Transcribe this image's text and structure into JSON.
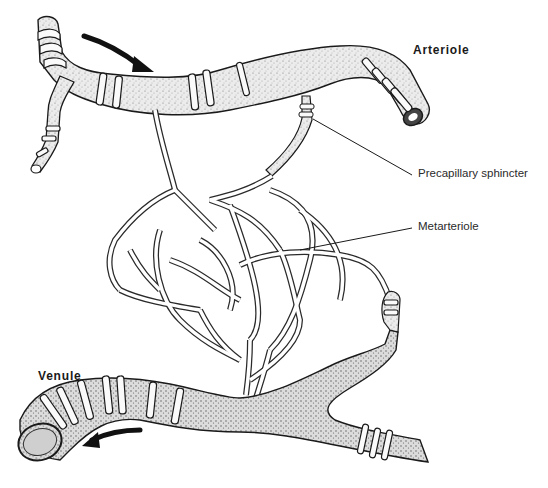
{
  "figure": {
    "type": "anatomical illustration",
    "labels": {
      "arteriole": "Arteriole",
      "precapillary_sphincter": "Precapillary sphincter",
      "metarteriole": "Metarteriole",
      "venule": "Venule"
    },
    "flow_arrows": [
      {
        "name": "arteriole-inflow-arrow",
        "direction": "right/down"
      },
      {
        "name": "venule-outflow-arrow",
        "direction": "left"
      }
    ],
    "colors": {
      "ink": "#1a1a1a",
      "vessel_fill": "#e9e9e9",
      "background": "#ffffff"
    }
  }
}
